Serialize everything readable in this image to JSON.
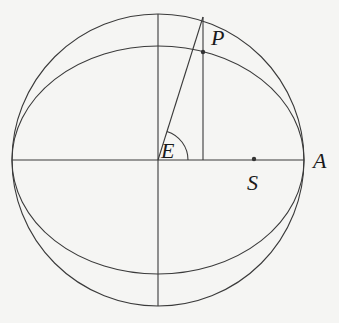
{
  "diagram": {
    "labels": {
      "P": "P",
      "E": "E",
      "A": "A",
      "S": "S"
    },
    "geometry": {
      "center": [
        158,
        160
      ],
      "circle_radius": 146,
      "ellipse_semi_major": 146,
      "ellipse_semi_minor": 114,
      "point_P": [
        203,
        52
      ],
      "circle_point_above_P": [
        203,
        17
      ],
      "focus_S": [
        254,
        159
      ],
      "point_A": [
        304,
        160
      ]
    },
    "colors": {
      "line": "#3a3a3a",
      "background": "#f5f5f3"
    }
  }
}
